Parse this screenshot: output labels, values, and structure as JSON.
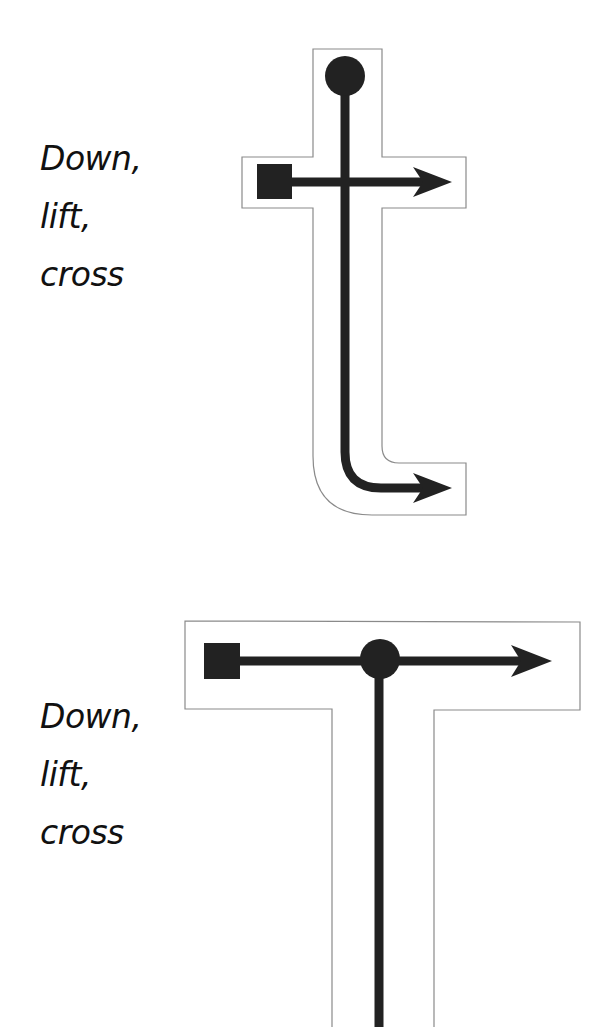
{
  "diagrams": [
    {
      "letter": "t",
      "caption": {
        "line1": "Down,",
        "line2": "lift,",
        "line3": "cross"
      },
      "strokes": [
        {
          "order": 1,
          "start": "circle",
          "direction": "down then curve right",
          "end": "arrow"
        },
        {
          "order": 2,
          "start": "square",
          "direction": "left to right",
          "end": "arrow"
        }
      ]
    },
    {
      "letter": "T",
      "caption": {
        "line1": "Down,",
        "line2": "lift,",
        "line3": "cross"
      },
      "strokes": [
        {
          "order": 1,
          "start": "circle",
          "direction": "down",
          "end": "off-page"
        },
        {
          "order": 2,
          "start": "square",
          "direction": "left to right",
          "end": "arrow"
        }
      ]
    }
  ],
  "colors": {
    "stroke": "#222222",
    "outline": "#8a8a8a",
    "background": "#ffffff"
  }
}
